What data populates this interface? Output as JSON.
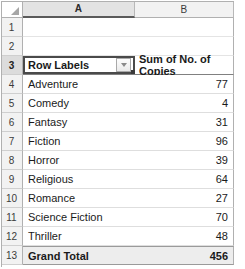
{
  "spreadsheet": {
    "select_all_icon": "select-all-triangle-icon",
    "columns": [
      {
        "label": "A",
        "active": true
      },
      {
        "label": "B",
        "active": false
      }
    ],
    "rows": [
      {
        "number": "1",
        "a": "",
        "b": "",
        "type": "blank"
      },
      {
        "number": "2",
        "a": "",
        "b": "",
        "type": "blank"
      },
      {
        "number": "3",
        "a": "Row Labels",
        "b": "Sum of No. of Copies",
        "type": "pivot-header",
        "filter_icon": "filter-dropdown-icon",
        "selected": true
      },
      {
        "number": "4",
        "a": "Adventure",
        "b": "77",
        "type": "data"
      },
      {
        "number": "5",
        "a": "Comedy",
        "b": "4",
        "type": "data"
      },
      {
        "number": "6",
        "a": "Fantasy",
        "b": "31",
        "type": "data"
      },
      {
        "number": "7",
        "a": "Fiction",
        "b": "96",
        "type": "data"
      },
      {
        "number": "8",
        "a": "Horror",
        "b": "39",
        "type": "data"
      },
      {
        "number": "9",
        "a": "Religious",
        "b": "64",
        "type": "data"
      },
      {
        "number": "10",
        "a": "Romance",
        "b": "27",
        "type": "data"
      },
      {
        "number": "11",
        "a": "Science Fiction",
        "b": "70",
        "type": "data"
      },
      {
        "number": "12",
        "a": "Thriller",
        "b": "48",
        "type": "data"
      },
      {
        "number": "13",
        "a": "Grand Total",
        "b": "456",
        "type": "grand"
      }
    ]
  },
  "chart_data": {
    "type": "table",
    "columns": [
      "Row Labels",
      "Sum of No. of Copies"
    ],
    "categories": [
      "Adventure",
      "Comedy",
      "Fantasy",
      "Fiction",
      "Horror",
      "Religious",
      "Romance",
      "Science Fiction",
      "Thriller"
    ],
    "values": [
      77,
      4,
      31,
      96,
      39,
      64,
      27,
      70,
      48
    ],
    "total_label": "Grand Total",
    "total": 456
  }
}
